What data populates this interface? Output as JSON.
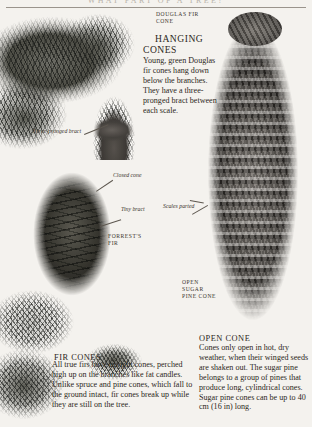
{
  "page": {
    "running_head": "WHAT PART OF A TREE?",
    "background_color": "#f4f2ee",
    "ink_color": "#2c2721"
  },
  "figures": [
    {
      "id": "douglas-fir-branch",
      "alt_name": "douglas-fir-branch-photo"
    },
    {
      "id": "closed-fir-cone",
      "alt_name": "closed-fir-cone-photo"
    },
    {
      "id": "fir-foliage",
      "alt_name": "fir-foliage-photo"
    },
    {
      "id": "fir-cone-cluster",
      "alt_name": "fir-cone-cluster-photo"
    },
    {
      "id": "open-sugar-pine-cone",
      "alt_name": "open-sugar-pine-cone-photo"
    }
  ],
  "labels": {
    "douglas_fir_cone": "DOUGLAS FIR CONE",
    "three_pronged_bract": "Three-pronged bract",
    "closed_cone": "Closed cone",
    "tiny_bract": "Tiny bract",
    "forrests_fir": "FORREST'S FIR",
    "scales_parted": "Scales parted",
    "open_sugar_pine_cone": "OPEN SUGAR PINE CONE"
  },
  "sections": {
    "hanging_cones": {
      "heading_line1": "HANGING",
      "heading_line2": "CONES",
      "body": "Young, green Douglas fir cones hang down below the branches. They have a three-pronged bract between each scale."
    },
    "fir_cones": {
      "heading": "FIR CONES",
      "body": "All true firs have upright cones, perched high up on the branches like fat candles. Unlike spruce and pine cones, which fall to the ground intact, fir cones break up while they are still on the tree."
    },
    "open_cone": {
      "heading": "OPEN CONE",
      "body": "Cones only open in hot, dry weather, when their winged seeds are shaken out. The sugar pine belongs to a group of pines that produce long, cylindrical cones. Sugar pine cones can be up to 40 cm (16 in) long."
    }
  }
}
